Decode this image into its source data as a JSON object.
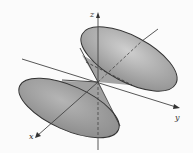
{
  "diagram": {
    "axes": {
      "x_label": "x",
      "y_label": "y",
      "z_label": "z"
    },
    "colors": {
      "background": "#fbfbfb",
      "surface_fill": "#9e9e9e",
      "surface_highlight": "#c8c8c8",
      "outline": "#333333",
      "axis": "#444444"
    }
  }
}
